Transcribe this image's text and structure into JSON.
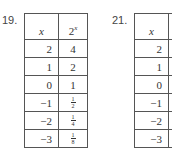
{
  "problems": [
    {
      "number": "19.",
      "header": {
        "x": "x",
        "fx_base": "2",
        "fx_exp": "x"
      },
      "rows": [
        {
          "x": "2",
          "y": "4"
        },
        {
          "x": "1",
          "y": "2"
        },
        {
          "x": "0",
          "y": "1"
        },
        {
          "x": "−1",
          "y_num": "1",
          "y_den": "2"
        },
        {
          "x": "−2",
          "y_num": "1",
          "y_den": "4"
        },
        {
          "x": "−3",
          "y_num": "1",
          "y_den": "8"
        }
      ]
    },
    {
      "number": "21.",
      "header": {
        "x": "x"
      },
      "rows": [
        {
          "x": "2"
        },
        {
          "x": "1"
        },
        {
          "x": "0"
        },
        {
          "x": "−1"
        },
        {
          "x": "−2"
        },
        {
          "x": "−3"
        }
      ]
    }
  ]
}
